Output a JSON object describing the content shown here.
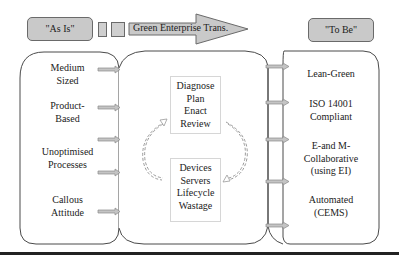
{
  "header": {
    "as_is_label": "\"As Is\"",
    "arrow_label": "Green Enterprise Trans.",
    "to_be_label": "\"To Be\""
  },
  "left_panel": {
    "items": [
      {
        "line1": "Medium",
        "line2": "Sized"
      },
      {
        "line1": "Product-",
        "line2": "Based"
      },
      {
        "line1": "Unoptimised",
        "line2": "Processes"
      },
      {
        "line1": "Callous",
        "line2": "Attitude"
      }
    ]
  },
  "center_panel": {
    "top_box": [
      "Diagnose",
      "Plan",
      "Enact",
      "Review"
    ],
    "bottom_box": [
      "Devices",
      "Servers",
      "Lifecycle",
      "Wastage"
    ],
    "cycle_icon": "dashed-circular-arrows"
  },
  "right_panel": {
    "items": [
      {
        "line1": "Lean-Green",
        "line2": ""
      },
      {
        "line1": "ISO 14001",
        "line2": "Compliant"
      },
      {
        "line1": "E-and M-",
        "line2": "Collaborative",
        "line3": "(using EI)"
      },
      {
        "line1": "Automated",
        "line2": "(CEMS)"
      }
    ]
  },
  "colors": {
    "fill_gray": "#c9c9c9",
    "stroke": "#4a4a4a",
    "arrow_fill": "#c4c4c4"
  }
}
